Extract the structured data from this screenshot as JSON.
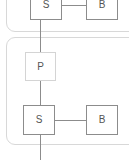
{
  "diagram": {
    "canvas": {
      "width": 129,
      "height": 160,
      "background": "#ffffff"
    },
    "colors": {
      "group_border": "#d8d8d8",
      "node_border_strong": "#8c8c8c",
      "node_border_soft": "#d4d4d4",
      "node_fill": "#ffffff",
      "edge": "#8c8c8c",
      "label_text": "#555555"
    },
    "groups": [
      {
        "id": "group-upper",
        "label": "",
        "x": 6,
        "y": -26,
        "width": 136,
        "height": 58,
        "border_color": "#d8d8d8",
        "note": "cropped at top and right edges of the viewport"
      },
      {
        "id": "group-lower",
        "label": "",
        "x": 6,
        "y": 37,
        "width": 136,
        "height": 108,
        "border_color": "#d8d8d8",
        "note": "cropped at right edge of the viewport"
      }
    ],
    "nodes": [
      {
        "id": "node-s-top",
        "label": "S",
        "x": 30,
        "y": -11,
        "width": 32,
        "height": 31,
        "border_color": "#8c8c8c",
        "group": "group-upper"
      },
      {
        "id": "node-b-top",
        "label": "B",
        "x": 86,
        "y": -11,
        "width": 32,
        "height": 31,
        "border_color": "#8c8c8c",
        "group": "group-upper"
      },
      {
        "id": "node-p",
        "label": "P",
        "x": 25,
        "y": 52,
        "width": 31,
        "height": 29,
        "border_color": "#d4d4d4",
        "group": "group-lower"
      },
      {
        "id": "node-s-bottom",
        "label": "S",
        "x": 23,
        "y": 105,
        "width": 32,
        "height": 30,
        "border_color": "#8c8c8c",
        "group": "group-lower"
      },
      {
        "id": "node-b-bottom",
        "label": "B",
        "x": 86,
        "y": 105,
        "width": 32,
        "height": 30,
        "border_color": "#8c8c8c",
        "group": "group-lower"
      }
    ],
    "edges": [
      {
        "id": "edge-s-top-to-b-top",
        "from": "node-s-top",
        "to": "node-b-top",
        "orientation": "horizontal",
        "x": 62,
        "y": 5,
        "length": 24
      },
      {
        "id": "edge-s-top-to-p",
        "from": "node-s-top",
        "to": "node-p",
        "orientation": "vertical",
        "x": 40,
        "y": 20,
        "length": 32
      },
      {
        "id": "edge-p-to-s-bottom",
        "from": "node-p",
        "to": "node-s-bottom",
        "orientation": "vertical",
        "x": 40,
        "y": 81,
        "length": 24
      },
      {
        "id": "edge-s-bottom-to-b-bottom",
        "from": "node-s-bottom",
        "to": "node-b-bottom",
        "orientation": "horizontal",
        "x": 55,
        "y": 120,
        "length": 31
      },
      {
        "id": "edge-s-bottom-outflow",
        "from": "node-s-bottom",
        "to": "",
        "orientation": "vertical",
        "x": 40,
        "y": 135,
        "length": 25
      }
    ]
  }
}
